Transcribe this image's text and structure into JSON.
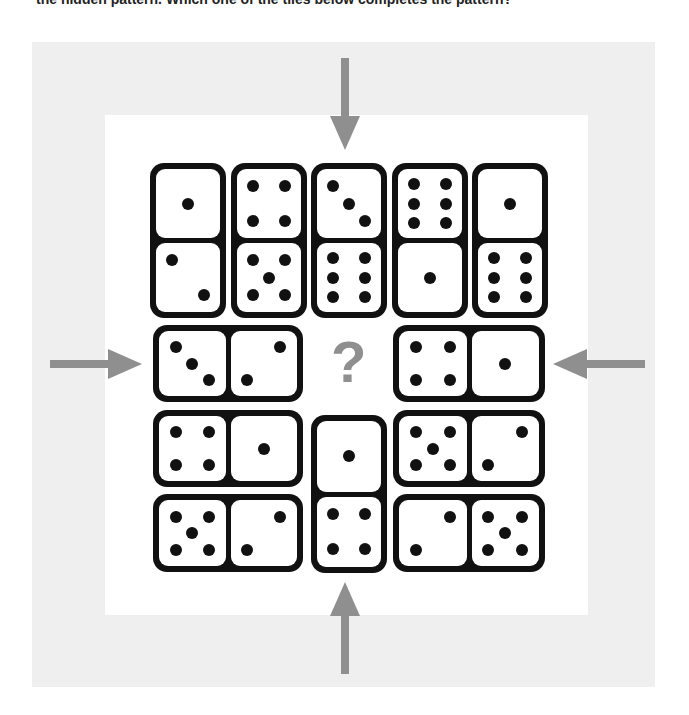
{
  "caption": "the hidden pattern. Which one of the tiles below completes the pattern?",
  "question_mark": "?",
  "colors": {
    "panel": "#efefef",
    "board": "#ffffff",
    "domino": "#111111",
    "arrow": "#8f8f8f"
  },
  "arrows": [
    {
      "name": "arrow-down-icon",
      "direction": "down"
    },
    {
      "name": "arrow-right-icon",
      "direction": "right"
    },
    {
      "name": "arrow-left-icon",
      "direction": "left"
    },
    {
      "name": "arrow-up-icon",
      "direction": "up"
    }
  ],
  "dominoes": [
    {
      "id": "r1c1",
      "orientation": "vertical",
      "values": [
        1,
        2
      ],
      "x": 150,
      "y": 163,
      "w": 76,
      "h": 155
    },
    {
      "id": "r1c2",
      "orientation": "vertical",
      "values": [
        4,
        5
      ],
      "x": 231,
      "y": 163,
      "w": 76,
      "h": 155
    },
    {
      "id": "r1c3",
      "orientation": "vertical",
      "values": [
        3,
        6
      ],
      "x": 311,
      "y": 163,
      "w": 76,
      "h": 155
    },
    {
      "id": "r1c4",
      "orientation": "vertical",
      "values": [
        6,
        1
      ],
      "x": 392,
      "y": 163,
      "w": 76,
      "h": 155
    },
    {
      "id": "r1c5",
      "orientation": "vertical",
      "values": [
        1,
        6
      ],
      "x": 472,
      "y": 163,
      "w": 76,
      "h": 155
    },
    {
      "id": "r2-left",
      "orientation": "horizontal",
      "values": [
        3,
        2
      ],
      "x": 153,
      "y": 325,
      "w": 150,
      "h": 77
    },
    {
      "id": "r2-right",
      "orientation": "horizontal",
      "values": [
        4,
        1
      ],
      "x": 393,
      "y": 325,
      "w": 152,
      "h": 77
    },
    {
      "id": "r3-left",
      "orientation": "horizontal",
      "values": [
        4,
        1
      ],
      "x": 153,
      "y": 410,
      "w": 150,
      "h": 77
    },
    {
      "id": "r3-center",
      "orientation": "vertical",
      "values": [
        1,
        4
      ],
      "x": 311,
      "y": 415,
      "w": 76,
      "h": 158
    },
    {
      "id": "r3-right",
      "orientation": "horizontal",
      "values": [
        5,
        2
      ],
      "x": 393,
      "y": 410,
      "w": 152,
      "h": 77
    },
    {
      "id": "r4-left",
      "orientation": "horizontal",
      "values": [
        5,
        2
      ],
      "x": 153,
      "y": 494,
      "w": 150,
      "h": 78
    },
    {
      "id": "r4-right",
      "orientation": "horizontal",
      "values": [
        2,
        5
      ],
      "x": 393,
      "y": 494,
      "w": 152,
      "h": 78
    }
  ]
}
